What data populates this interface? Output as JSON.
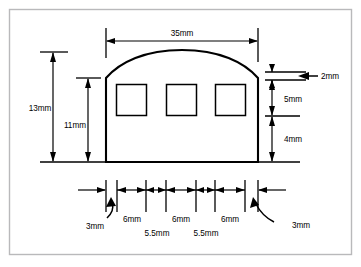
{
  "colors": {
    "line": "#000000",
    "frame": "#b9b9bb",
    "background": "#ffffff"
  },
  "dimensions": {
    "overall_width": "35mm",
    "overall_height": "13mm",
    "wall_height": "11mm",
    "top_edge_thickness": "2mm",
    "window_height": "5mm",
    "below_window_height": "4mm",
    "left_margin": "3mm",
    "right_margin": "3mm",
    "window_width_1": "6mm",
    "window_width_2": "6mm",
    "window_width_3": "6mm",
    "gap_1": "5.5mm",
    "gap_2": "5.5mm"
  },
  "labels": {
    "width_35": "35mm",
    "height_13": "13mm",
    "height_11": "11mm",
    "edge_2": "2mm",
    "window_5": "5mm",
    "base_4": "4mm",
    "left_3": "3mm",
    "right_3": "3mm",
    "span_6_a": "6mm",
    "span_6_b": "6mm",
    "span_6_c": "6mm",
    "gap_55_a": "5.5mm",
    "gap_55_b": "5.5mm"
  },
  "geometry": {
    "outline_left_x": 106,
    "outline_right_x": 258,
    "outline_base_y": 162,
    "outline_shoulder_y": 78,
    "outline_apex_y": 50,
    "windows": [
      {
        "x": 116,
        "y": 84,
        "w": 31,
        "h": 32
      },
      {
        "x": 166,
        "y": 84,
        "w": 31,
        "h": 32
      },
      {
        "x": 215,
        "y": 84,
        "w": 31,
        "h": 32
      }
    ]
  }
}
